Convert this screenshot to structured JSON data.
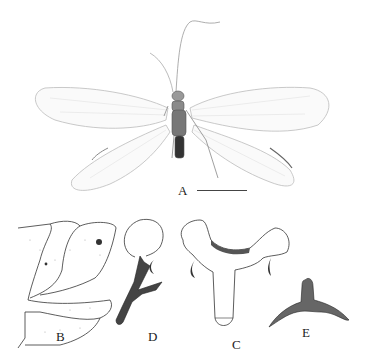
{
  "figure": {
    "panels": [
      {
        "id": "A",
        "label": "A",
        "description": "Habitus of adult lacewing, dorsal view, wings spread"
      },
      {
        "id": "B",
        "label": "B",
        "description": "Terminal abdominal segments, lateral view"
      },
      {
        "id": "C",
        "label": "C",
        "description": "Genital structure, dorsal view"
      },
      {
        "id": "D",
        "label": "D",
        "description": "Genital structure, lateral view"
      },
      {
        "id": "E",
        "label": "E",
        "description": "Sclerite, ventral view"
      }
    ],
    "scale_bar": {
      "panel": "A"
    },
    "colors": {
      "background": "#ffffff",
      "ink": "#222222",
      "wing": "#bdbdbd",
      "body": "#555555"
    }
  }
}
